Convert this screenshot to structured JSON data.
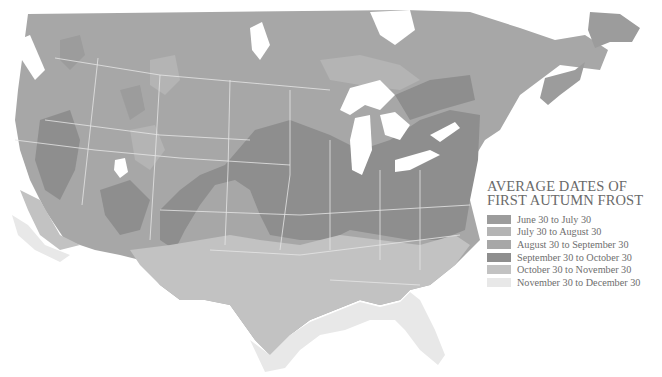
{
  "map": {
    "title_line1": "AVERAGE DATES OF",
    "title_line2": "FIRST AUTUMN FROST",
    "region": "United States and southern Canada",
    "colors": {
      "background": "#ffffff",
      "water": "#ffffff",
      "borders": "#e6e6e6"
    },
    "legend": [
      {
        "label": "June 30 to July 30",
        "color": "#9c9c9c"
      },
      {
        "label": "July 30 to August 30",
        "color": "#b4b4b4"
      },
      {
        "label": "August 30 to September 30",
        "color": "#a7a7a7"
      },
      {
        "label": "September 30 to October 30",
        "color": "#8e8e8e"
      },
      {
        "label": "October 30 to November 30",
        "color": "#c2c2c2"
      },
      {
        "label": "November 30 to December 30",
        "color": "#e8e8e8"
      }
    ]
  }
}
